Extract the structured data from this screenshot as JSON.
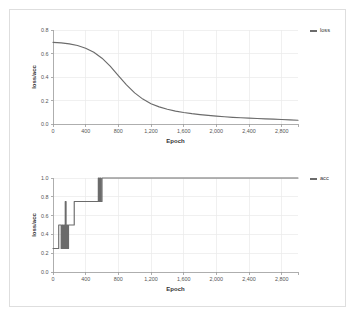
{
  "figure": {
    "background_color": "#ffffff",
    "panel_border_color": "#dedede",
    "series_color": "#6b6b6b",
    "grid_color": "#e9e9e9",
    "axis_color": "#9a9a9a"
  },
  "chart_data": [
    {
      "type": "line",
      "id": "loss-chart",
      "title": "",
      "xlabel": "Epoch",
      "ylabel": "loss/acc",
      "xlim": [
        0,
        3000
      ],
      "ylim": [
        0.0,
        0.8
      ],
      "grid": true,
      "legend_position": "right",
      "xticks": [
        0,
        400,
        800,
        1200,
        1600,
        2000,
        2400,
        2800
      ],
      "xtick_labels": [
        "0",
        "400",
        "800",
        "1,200",
        "1,600",
        "2,000",
        "2,400",
        "2,800"
      ],
      "yticks": [
        0.0,
        0.2,
        0.4,
        0.6,
        0.8
      ],
      "ytick_labels": [
        "0.0",
        "0.2",
        "0.4",
        "0.6",
        "0.8"
      ],
      "series": [
        {
          "name": "loss",
          "color": "#6b6b6b",
          "x": [
            0,
            100,
            200,
            300,
            400,
            500,
            600,
            700,
            800,
            900,
            1000,
            1100,
            1200,
            1300,
            1400,
            1500,
            1600,
            1700,
            1800,
            1900,
            2000,
            2100,
            2200,
            2300,
            2400,
            2500,
            2600,
            2700,
            2800,
            2900,
            3000
          ],
          "values": [
            0.695,
            0.69,
            0.682,
            0.668,
            0.645,
            0.61,
            0.56,
            0.492,
            0.412,
            0.333,
            0.265,
            0.212,
            0.173,
            0.146,
            0.126,
            0.11,
            0.098,
            0.088,
            0.08,
            0.073,
            0.067,
            0.062,
            0.057,
            0.053,
            0.05,
            0.047,
            0.044,
            0.041,
            0.038,
            0.035,
            0.032
          ]
        }
      ]
    },
    {
      "type": "line",
      "id": "acc-chart",
      "title": "",
      "xlabel": "Epoch",
      "ylabel": "loss/acc",
      "xlim": [
        0,
        3000
      ],
      "ylim": [
        0.0,
        1.0
      ],
      "grid": true,
      "legend_position": "right",
      "xticks": [
        0,
        400,
        800,
        1200,
        1600,
        2000,
        2400,
        2800
      ],
      "xtick_labels": [
        "0",
        "400",
        "800",
        "1,200",
        "1,600",
        "2,000",
        "2,400",
        "2,800"
      ],
      "yticks": [
        0.0,
        0.2,
        0.4,
        0.6,
        0.8,
        1.0
      ],
      "ytick_labels": [
        "0.0",
        "0.2",
        "0.4",
        "0.6",
        "0.8",
        "1.0"
      ],
      "series": [
        {
          "name": "acc",
          "color": "#6b6b6b",
          "step": true,
          "x": [
            0,
            60,
            70,
            90,
            100,
            110,
            120,
            130,
            140,
            150,
            160,
            170,
            180,
            190,
            200,
            210,
            230,
            250,
            260,
            540,
            555,
            565,
            575,
            585,
            600,
            3000
          ],
          "values": [
            0.25,
            0.25,
            0.5,
            0.5,
            0.25,
            0.5,
            0.25,
            0.5,
            0.25,
            0.75,
            0.25,
            0.5,
            0.25,
            0.5,
            0.5,
            0.5,
            0.5,
            0.5,
            0.75,
            0.75,
            1.0,
            0.75,
            1.0,
            0.75,
            1.0,
            1.0
          ]
        }
      ]
    }
  ]
}
